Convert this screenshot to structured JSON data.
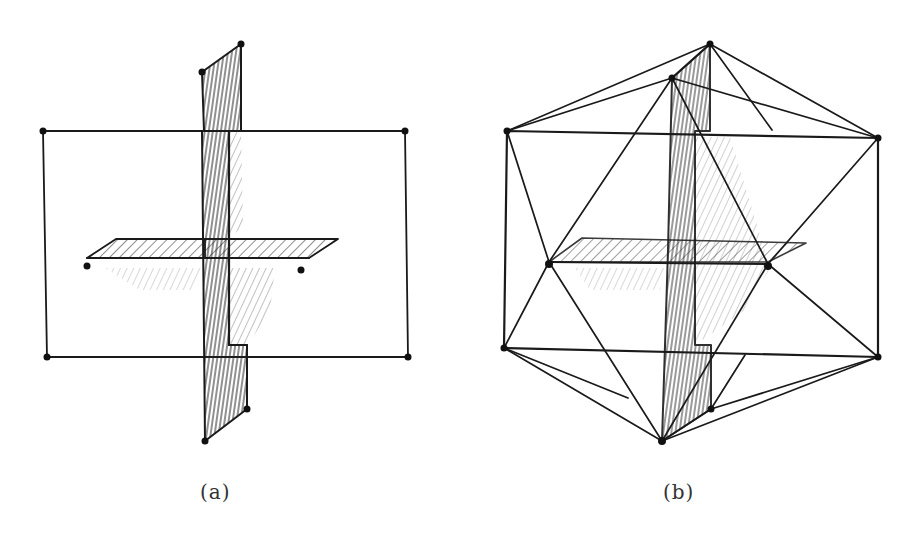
{
  "figure": {
    "panels": [
      {
        "id": "a",
        "caption": "(a)",
        "description": "Three mutually perpendicular golden rectangles"
      },
      {
        "id": "b",
        "caption": "(b)",
        "description": "Icosahedron formed by connecting the vertices of the three golden rectangles"
      }
    ],
    "colors": {
      "ink": "#1a1a1a",
      "background": "#ffffff",
      "hatch": "#444444"
    }
  }
}
